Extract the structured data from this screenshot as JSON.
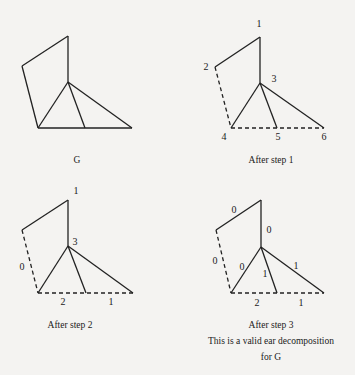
{
  "panels": [
    {
      "id": "G",
      "caption": [
        "G"
      ],
      "vertices": {
        "top": [
          68,
          36
        ],
        "left": [
          22,
          66
        ],
        "center": [
          68,
          82
        ],
        "bl": [
          38,
          128
        ],
        "bm": [
          85,
          128
        ],
        "br": [
          132,
          128
        ]
      },
      "vertex_labels": [],
      "edges": [
        {
          "a": "top",
          "b": "left",
          "dashed": false
        },
        {
          "a": "top",
          "b": "center",
          "dashed": false
        },
        {
          "a": "left",
          "b": "bl",
          "dashed": false
        },
        {
          "a": "center",
          "b": "bl",
          "dashed": false
        },
        {
          "a": "center",
          "b": "bm",
          "dashed": false
        },
        {
          "a": "center",
          "b": "br",
          "dashed": false
        },
        {
          "a": "bl",
          "b": "br",
          "dashed": false
        }
      ],
      "edge_labels": [],
      "caption_pos": [
        [
          77,
          163
        ]
      ]
    },
    {
      "id": "step1",
      "caption": [
        "After step 1"
      ],
      "vertices": {
        "top": [
          260,
          37
        ],
        "left": [
          215,
          67
        ],
        "center": [
          260,
          83
        ],
        "bl": [
          231,
          128
        ],
        "bm": [
          277,
          128
        ],
        "br": [
          324,
          128
        ]
      },
      "vertex_labels": [
        {
          "text": "1",
          "x": 259,
          "y": 27
        },
        {
          "text": "2",
          "x": 206,
          "y": 70
        },
        {
          "text": "3",
          "x": 274,
          "y": 82
        },
        {
          "text": "4",
          "x": 224,
          "y": 140
        },
        {
          "text": "5",
          "x": 278,
          "y": 140
        },
        {
          "text": "6",
          "x": 324,
          "y": 140
        }
      ],
      "edges": [
        {
          "a": "top",
          "b": "left",
          "dashed": false
        },
        {
          "a": "top",
          "b": "center",
          "dashed": false
        },
        {
          "a": "left",
          "b": "bl",
          "dashed": true
        },
        {
          "a": "center",
          "b": "bl",
          "dashed": false
        },
        {
          "a": "center",
          "b": "bm",
          "dashed": false
        },
        {
          "a": "center",
          "b": "br",
          "dashed": false
        },
        {
          "a": "bl",
          "b": "br",
          "dashed": true
        }
      ],
      "edge_labels": [],
      "caption_pos": [
        [
          271,
          163
        ]
      ]
    },
    {
      "id": "step2",
      "caption": [
        "After step 2"
      ],
      "vertices": {
        "top": [
          68,
          200
        ],
        "left": [
          22,
          230
        ],
        "center": [
          68,
          246
        ],
        "bl": [
          38,
          293
        ],
        "bm": [
          86,
          293
        ],
        "br": [
          133,
          293
        ]
      },
      "vertex_labels": [
        {
          "text": "1",
          "x": 76,
          "y": 194
        },
        {
          "text": "3",
          "x": 75,
          "y": 245
        }
      ],
      "edges": [
        {
          "a": "top",
          "b": "left",
          "dashed": false
        },
        {
          "a": "top",
          "b": "center",
          "dashed": false
        },
        {
          "a": "left",
          "b": "bl",
          "dashed": true
        },
        {
          "a": "center",
          "b": "bl",
          "dashed": false
        },
        {
          "a": "center",
          "b": "bm",
          "dashed": false
        },
        {
          "a": "center",
          "b": "br",
          "dashed": false
        },
        {
          "a": "bl",
          "b": "br",
          "dashed": true
        }
      ],
      "edge_labels": [
        {
          "text": "0",
          "x": 22,
          "y": 270
        },
        {
          "text": "2",
          "x": 63,
          "y": 305
        },
        {
          "text": "1",
          "x": 111,
          "y": 305
        }
      ],
      "caption_pos": [
        [
          70,
          328
        ]
      ]
    },
    {
      "id": "step3",
      "caption": [
        "After step 3",
        "This is a valid ear decomposition",
        "for G"
      ],
      "vertices": {
        "top": [
          261,
          200
        ],
        "left": [
          216,
          230
        ],
        "center": [
          261,
          247
        ],
        "bl": [
          231,
          293
        ],
        "bm": [
          277,
          293
        ],
        "br": [
          324,
          293
        ]
      },
      "vertex_labels": [],
      "edges": [
        {
          "a": "top",
          "b": "left",
          "dashed": false
        },
        {
          "a": "top",
          "b": "center",
          "dashed": false
        },
        {
          "a": "left",
          "b": "bl",
          "dashed": true
        },
        {
          "a": "center",
          "b": "bl",
          "dashed": false
        },
        {
          "a": "center",
          "b": "bm",
          "dashed": false
        },
        {
          "a": "center",
          "b": "br",
          "dashed": false
        },
        {
          "a": "bl",
          "b": "br",
          "dashed": true
        }
      ],
      "edge_labels": [
        {
          "text": "0",
          "x": 234,
          "y": 213
        },
        {
          "text": "0",
          "x": 269,
          "y": 233
        },
        {
          "text": "0",
          "x": 215,
          "y": 264
        },
        {
          "text": "0",
          "x": 242,
          "y": 270
        },
        {
          "text": "1",
          "x": 265,
          "y": 277
        },
        {
          "text": "1",
          "x": 296,
          "y": 269
        },
        {
          "text": "2",
          "x": 257,
          "y": 306
        },
        {
          "text": "1",
          "x": 301,
          "y": 306
        }
      ],
      "caption_pos": [
        [
          271,
          328
        ],
        [
          271,
          344
        ],
        [
          271,
          360
        ]
      ]
    }
  ]
}
